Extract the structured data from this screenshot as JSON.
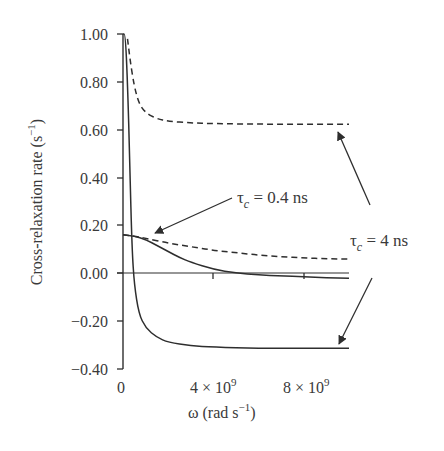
{
  "chart_data": {
    "type": "line",
    "title": "",
    "xlabel": "ω (rad s⁻¹)",
    "ylabel": "Cross-relaxation rate (s⁻¹)",
    "xlim": [
      0,
      10000000000.0
    ],
    "ylim": [
      -0.4,
      1.0
    ],
    "grid": false,
    "legend": "none (curves labeled by annotations)",
    "x_ticks": [
      {
        "value": 0,
        "label": "0"
      },
      {
        "value": 4000000000.0,
        "label": "4 × 10⁹"
      },
      {
        "value": 8000000000.0,
        "label": "8 × 10⁹"
      }
    ],
    "y_ticks": [
      {
        "value": 1.0,
        "label": "1.00"
      },
      {
        "value": 0.8,
        "label": "0.80"
      },
      {
        "value": 0.6,
        "label": "0.60"
      },
      {
        "value": 0.4,
        "label": "0.40"
      },
      {
        "value": 0.2,
        "label": "0.20"
      },
      {
        "value": 0.0,
        "label": "0.00"
      },
      {
        "value": -0.2,
        "label": "-0.20"
      },
      {
        "value": -0.4,
        "label": "-0.40"
      }
    ],
    "x": [
      0,
      250000000.0,
      500000000.0,
      750000000.0,
      1000000000.0,
      1500000000.0,
      2000000000.0,
      3000000000.0,
      4000000000.0,
      5000000000.0,
      6000000000.0,
      7000000000.0,
      8000000000.0,
      9000000000.0,
      10000000000.0
    ],
    "series": [
      {
        "name": "τc = 4 ns, dashed (upper)",
        "style": "dashed",
        "x": [
          200000000.0,
          300000000.0,
          500000000.0,
          700000000.0,
          1000000000.0,
          1500000000.0,
          2000000000.0,
          3000000000.0,
          4000000000.0,
          6000000000.0,
          8000000000.0,
          10000000000.0
        ],
        "values": [
          0.98,
          0.9,
          0.78,
          0.71,
          0.67,
          0.645,
          0.635,
          0.628,
          0.625,
          0.623,
          0.622,
          0.622
        ]
      },
      {
        "name": "τc = 4 ns, solid (lower)",
        "style": "solid",
        "x": [
          0,
          100000000.0,
          200000000.0,
          300000000.0,
          400000000.0,
          500000000.0,
          700000000.0,
          1000000000.0,
          1500000000.0,
          2000000000.0,
          3000000000.0,
          4000000000.0,
          6000000000.0,
          8000000000.0,
          10000000000.0
        ],
        "values": [
          1.0,
          1.0,
          0.8,
          0.45,
          0.1,
          -0.05,
          -0.17,
          -0.23,
          -0.27,
          -0.29,
          -0.305,
          -0.31,
          -0.315,
          -0.315,
          -0.315
        ]
      },
      {
        "name": "τc = 0.4 ns, dashed (upper)",
        "style": "dashed",
        "x": [
          0,
          500000000.0,
          1000000000.0,
          2000000000.0,
          3000000000.0,
          4000000000.0,
          5000000000.0,
          6000000000.0,
          7000000000.0,
          8000000000.0,
          9000000000.0,
          10000000000.0
        ],
        "values": [
          0.16,
          0.155,
          0.145,
          0.125,
          0.11,
          0.095,
          0.085,
          0.075,
          0.068,
          0.063,
          0.06,
          0.058
        ]
      },
      {
        "name": "τc = 0.4 ns, solid (lower)",
        "style": "solid",
        "x": [
          0,
          500000000.0,
          1000000000.0,
          1500000000.0,
          2000000000.0,
          2500000000.0,
          3000000000.0,
          4000000000.0,
          5000000000.0,
          6000000000.0,
          7000000000.0,
          8000000000.0,
          9000000000.0,
          10000000000.0
        ],
        "values": [
          0.16,
          0.155,
          0.14,
          0.115,
          0.09,
          0.065,
          0.045,
          0.015,
          0.0,
          -0.008,
          -0.012,
          -0.016,
          -0.02,
          -0.022
        ]
      }
    ],
    "annotations": [
      {
        "text": "τc = 0.4 ns",
        "points_to": "τc = 0.4 ns curves near ω ≈ 1e9, y ≈ 0.16"
      },
      {
        "text": "τc = 4 ns",
        "points_to": [
          "τc = 4 ns dashed curve end (y ≈ 0.62)",
          "τc = 4 ns solid curve end (y ≈ -0.31)"
        ]
      }
    ]
  },
  "labels": {
    "ylabel_main": "Cross-relaxation rate (s",
    "ylabel_sup": "−1",
    "ylabel_close": ")",
    "xlabel_main": "ω (rad s",
    "xlabel_sup": "−1",
    "xlabel_close": ")",
    "x_tick_0": "0",
    "x_tick_4_mant": "4 × 10",
    "x_tick_4_exp": "9",
    "x_tick_8_mant": "8 × 10",
    "x_tick_8_exp": "9",
    "y_ticks": [
      "1.00",
      "0.80",
      "0.60",
      "0.40",
      "0.20",
      "0.00",
      "−0.20",
      "−0.40"
    ],
    "annot_04_tau": "τ",
    "annot_04_sub": "c",
    "annot_04_rest": " = 0.4 ns",
    "annot_4_tau": "τ",
    "annot_4_sub": "c",
    "annot_4_rest": " = 4 ns"
  },
  "colors": {
    "line": "#2e2e2e",
    "text": "#3a3a3a",
    "background": "#ffffff"
  }
}
